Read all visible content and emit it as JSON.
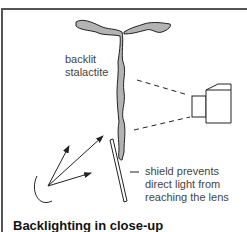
{
  "diagram": {
    "labels": {
      "stalactite_line1": "backlit",
      "stalactite_line2": "stalactite",
      "shield_line1": "shield prevents",
      "shield_line2": "direct light from",
      "shield_line3": "reaching the lens"
    },
    "caption": "Backlighting in close-up",
    "colors": {
      "stalactite_fill": "#b3b3b3",
      "line": "#222222",
      "frame": "#555555"
    }
  }
}
